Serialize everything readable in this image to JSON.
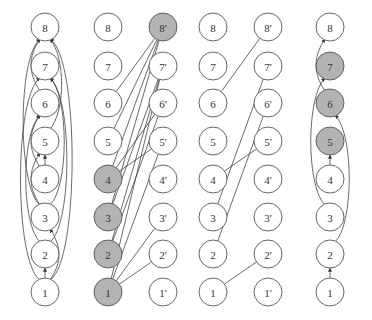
{
  "colors": {
    "highlight": "#b3b3b3",
    "plain": "#ffffff",
    "stroke": "#555555"
  },
  "layout": {
    "rows_y": {
      "8": 27,
      "7": 66,
      "6": 103,
      "5": 141,
      "4": 179,
      "3": 217,
      "2": 254,
      "1": 292
    },
    "radius": 14
  },
  "panels": [
    {
      "id": "dag",
      "columns": [
        {
          "x": 45,
          "labels": [
            "1",
            "2",
            "3",
            "4",
            "5",
            "6",
            "7",
            "8"
          ],
          "suffix": "",
          "highlighted": []
        }
      ],
      "arrows": [
        [
          "1",
          "2"
        ],
        [
          "1",
          "3"
        ],
        [
          "1",
          "7"
        ],
        [
          "1",
          "8"
        ],
        [
          "2",
          "6"
        ],
        [
          "2",
          "7"
        ],
        [
          "3",
          "5"
        ],
        [
          "3",
          "7"
        ],
        [
          "3",
          "8"
        ],
        [
          "4",
          "5"
        ],
        [
          "4",
          "6"
        ],
        [
          "5",
          "8"
        ],
        [
          "6",
          "8"
        ]
      ]
    },
    {
      "id": "bipartite",
      "columns": [
        {
          "x": 108,
          "labels": [
            "1",
            "2",
            "3",
            "4",
            "5",
            "6",
            "7",
            "8"
          ],
          "suffix": "",
          "highlighted": [
            "1",
            "2",
            "3",
            "4"
          ]
        },
        {
          "x": 163,
          "labels": [
            "1",
            "2",
            "3",
            "4",
            "5",
            "6",
            "7",
            "8"
          ],
          "suffix": "'",
          "highlighted": [
            "8"
          ]
        }
      ],
      "lines": [
        [
          "6",
          "8"
        ],
        [
          "5",
          "8"
        ],
        [
          "4",
          "8"
        ],
        [
          "3",
          "8"
        ],
        [
          "1",
          "7"
        ],
        [
          "2",
          "7"
        ],
        [
          "3",
          "7"
        ],
        [
          "4",
          "6"
        ],
        [
          "2",
          "6"
        ],
        [
          "4",
          "5"
        ],
        [
          "1",
          "3"
        ],
        [
          "1",
          "2"
        ],
        [
          "1",
          "5"
        ]
      ]
    },
    {
      "id": "matching",
      "columns": [
        {
          "x": 213,
          "labels": [
            "1",
            "2",
            "3",
            "4",
            "5",
            "6",
            "7",
            "8"
          ],
          "suffix": "",
          "highlighted": []
        },
        {
          "x": 268,
          "labels": [
            "1",
            "2",
            "3",
            "4",
            "5",
            "6",
            "7",
            "8"
          ],
          "suffix": "'",
          "highlighted": []
        }
      ],
      "lines": [
        [
          "6",
          "8"
        ],
        [
          "3",
          "7"
        ],
        [
          "2",
          "6"
        ],
        [
          "4",
          "5"
        ],
        [
          "1",
          "2"
        ]
      ]
    },
    {
      "id": "path-cover",
      "columns": [
        {
          "x": 330,
          "labels": [
            "1",
            "2",
            "3",
            "4",
            "5",
            "6",
            "7",
            "8"
          ],
          "suffix": "",
          "highlighted": [
            "5",
            "6",
            "7"
          ]
        }
      ],
      "arrows": [
        [
          "1",
          "2"
        ],
        [
          "2",
          "6"
        ],
        [
          "3",
          "7"
        ],
        [
          "4",
          "5"
        ],
        [
          "6",
          "8"
        ]
      ]
    }
  ]
}
